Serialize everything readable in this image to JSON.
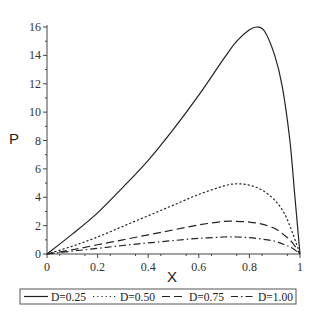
{
  "chart_data": {
    "type": "line",
    "title": "",
    "xlabel": "X",
    "ylabel": "P",
    "xlim": [
      0,
      1
    ],
    "ylim": [
      0,
      16
    ],
    "xticks": [
      "0",
      "0.2",
      "0.4",
      "0.6",
      "0.8",
      "1"
    ],
    "xtick_values": [
      0,
      0.2,
      0.4,
      0.6,
      0.8,
      1
    ],
    "yticks": [
      "0",
      "2",
      "4",
      "6",
      "8",
      "10",
      "12",
      "14",
      "16"
    ],
    "ytick_values": [
      0,
      2,
      4,
      6,
      8,
      10,
      12,
      14,
      16
    ],
    "grid": false,
    "legend_placement": "bottom",
    "series": [
      {
        "name": "D=0.25",
        "style": "solid",
        "x": [
          0,
          0.1,
          0.2,
          0.3,
          0.4,
          0.5,
          0.6,
          0.7,
          0.75,
          0.8,
          0.83,
          0.86,
          0.9,
          0.93,
          0.96,
          0.98,
          1.0
        ],
        "y": [
          0,
          1.4,
          2.9,
          4.7,
          6.6,
          8.8,
          11.2,
          13.8,
          15.0,
          15.8,
          16.0,
          15.7,
          14.0,
          11.8,
          8.0,
          4.0,
          0
        ]
      },
      {
        "name": "D=0.50",
        "style": "dotted",
        "x": [
          0,
          0.1,
          0.2,
          0.3,
          0.4,
          0.5,
          0.6,
          0.7,
          0.75,
          0.8,
          0.85,
          0.9,
          0.94,
          0.97,
          1.0
        ],
        "y": [
          0,
          0.55,
          1.2,
          1.95,
          2.7,
          3.45,
          4.2,
          4.8,
          4.95,
          4.85,
          4.5,
          3.8,
          2.8,
          1.5,
          0
        ]
      },
      {
        "name": "D=0.75",
        "style": "dashed",
        "x": [
          0,
          0.1,
          0.2,
          0.3,
          0.4,
          0.5,
          0.6,
          0.7,
          0.75,
          0.8,
          0.85,
          0.9,
          0.94,
          0.97,
          1.0
        ],
        "y": [
          0,
          0.3,
          0.65,
          1.0,
          1.35,
          1.7,
          2.05,
          2.3,
          2.3,
          2.25,
          2.1,
          1.8,
          1.3,
          0.8,
          0
        ]
      },
      {
        "name": "D=1.00",
        "style": "dashdot",
        "x": [
          0,
          0.1,
          0.2,
          0.3,
          0.4,
          0.5,
          0.6,
          0.7,
          0.75,
          0.8,
          0.85,
          0.9,
          0.94,
          0.97,
          1.0
        ],
        "y": [
          0,
          0.2,
          0.4,
          0.6,
          0.78,
          0.95,
          1.1,
          1.2,
          1.2,
          1.15,
          1.05,
          0.9,
          0.65,
          0.4,
          0
        ]
      }
    ]
  }
}
